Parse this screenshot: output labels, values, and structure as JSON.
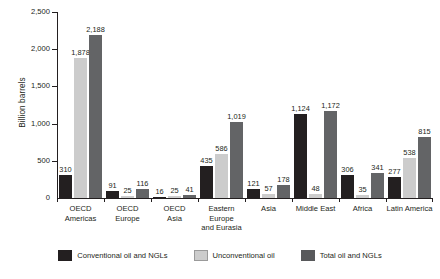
{
  "chart_data": {
    "type": "bar",
    "title": "",
    "subtitle": "",
    "xlabel": "",
    "ylabel": "Billion barrels",
    "ylim": [
      0,
      2500
    ],
    "yticks": [
      0,
      500,
      1000,
      1500,
      2000,
      2500
    ],
    "ytick_labels": [
      "0",
      "500",
      "1,000",
      "1,500",
      "2,000",
      "2,500"
    ],
    "grid": false,
    "legend_position": "bottom",
    "categories": [
      "OECD Americas",
      "OECD Europe",
      "OECD Asia",
      "Eastern Europe and Eurasia",
      "Asia",
      "Middle East",
      "Africa",
      "Latin America"
    ],
    "category_lines": [
      [
        "OECD",
        "Americas"
      ],
      [
        "OECD",
        "Europe"
      ],
      [
        "OECD",
        "Asia"
      ],
      [
        "Eastern Europe",
        "and Eurasia"
      ],
      [
        "Asia",
        ""
      ],
      [
        "Middle East",
        ""
      ],
      [
        "Africa",
        ""
      ],
      [
        "Latin America",
        ""
      ]
    ],
    "series": [
      {
        "name": "Conventional oil and NGLs",
        "color": "#231f20",
        "values": [
          310,
          91,
          16,
          435,
          121,
          1124,
          306,
          277
        ],
        "value_labels": [
          "310",
          "91",
          "16",
          "435",
          "121",
          "1,124",
          "306",
          "277"
        ]
      },
      {
        "name": "Unconventional oil",
        "color": "#cccccc",
        "values": [
          1878,
          25,
          25,
          586,
          57,
          48,
          35,
          538
        ],
        "value_labels": [
          "1,878",
          "25",
          "25",
          "586",
          "57",
          "48",
          "35",
          "538"
        ]
      },
      {
        "name": "Total oil and NGLs",
        "color": "#636466",
        "values": [
          2188,
          116,
          41,
          1019,
          178,
          1172,
          341,
          815
        ],
        "value_labels": [
          "2,188",
          "116",
          "41",
          "1,019",
          "178",
          "1,172",
          "341",
          "815"
        ]
      }
    ]
  },
  "legend": {
    "items": [
      {
        "label": "Conventional oil and NGLs",
        "swatch": "s0"
      },
      {
        "label": "Unconventional oil",
        "swatch": "s1"
      },
      {
        "label": "Total oil and NGLs",
        "swatch": "s2"
      }
    ]
  },
  "colors": {
    "series_conventional": "#231f20",
    "series_unconventional": "#cccccc",
    "series_total": "#636466",
    "axis": "#231f20",
    "background": "#ffffff"
  }
}
